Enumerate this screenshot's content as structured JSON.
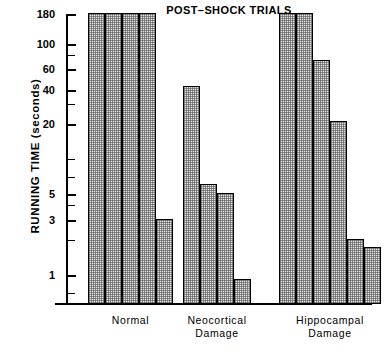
{
  "chart_data": {
    "type": "bar",
    "title": "POST–SHOCK\nTRIALS",
    "xlabel": "",
    "ylabel": "RUNNING TIME (seconds)",
    "yscale": "log",
    "ylim": [
      0.55,
      180
    ],
    "grid": false,
    "legend": "none",
    "ytick_labels": [
      "180",
      "100",
      "60",
      "40",
      "20",
      "5",
      "3",
      "1"
    ],
    "ytick_values": [
      180,
      100,
      60,
      40,
      20,
      5,
      3,
      1
    ],
    "minor_tick_values": [
      80,
      30,
      10,
      7,
      4,
      2,
      0.7
    ],
    "categories": [
      "Normal",
      "Neocortical Damage",
      "Hippocampal Damage"
    ],
    "groups": [
      {
        "name": "Normal",
        "label": "Normal",
        "values": [
          180,
          180,
          180,
          180,
          3
        ]
      },
      {
        "name": "Neocortical Damage",
        "label": "Neocortical\nDamage",
        "values": [
          42,
          6,
          5,
          0.9
        ]
      },
      {
        "name": "Hippocampal Damage",
        "label": "Hippocampal\nDamage",
        "values": [
          180,
          180,
          70,
          21,
          2,
          1.7
        ]
      }
    ],
    "colors": {
      "bar_fill": "#e3e3e3",
      "bar_edge": "#000000",
      "axis": "#000000",
      "text": "#000000",
      "background": "#ffffff"
    }
  }
}
